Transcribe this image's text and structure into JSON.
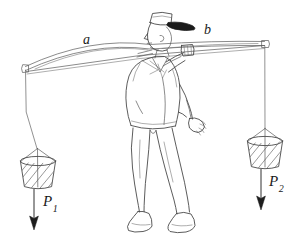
{
  "figure": {
    "kind": "physics-line-drawing",
    "background_color": "#ffffff",
    "ink_color": "#4a4a4a",
    "label_color": "#1a1a1a",
    "width": 298,
    "height": 249
  },
  "labels": {
    "segment_a": "a",
    "segment_b": "b",
    "force_left": "P",
    "force_left_sub": "1",
    "force_right": "P",
    "force_right_sub": "2"
  },
  "scene": {
    "pole": {
      "name": "carrying-pole",
      "left_end": [
        25,
        68
      ],
      "right_end": [
        265,
        43
      ],
      "shoulder_contact": [
        140,
        55
      ],
      "hand_grip": [
        185,
        52
      ],
      "bows_upward": true
    },
    "figure_person": {
      "name": "man",
      "facing": "right",
      "pose": "walking",
      "hat": "flat-cap-with-dark-brim",
      "head_center": [
        158,
        32
      ],
      "torso_center": [
        150,
        90
      ],
      "free_hand": [
        196,
        123
      ]
    },
    "load_left": {
      "name": "left-bucket",
      "center": [
        38,
        170
      ],
      "rim_y": 160,
      "hatched": true,
      "rope_top": [
        25,
        68
      ]
    },
    "load_right": {
      "name": "right-bucket",
      "center": [
        265,
        150
      ],
      "rim_y": 140,
      "hatched": true,
      "rope_top": [
        265,
        43
      ]
    },
    "arrow_left": {
      "name": "force-arrow-left",
      "from": [
        34,
        188
      ],
      "to": [
        34,
        228
      ],
      "direction": "down"
    },
    "arrow_right": {
      "name": "force-arrow-right",
      "from": [
        261,
        168
      ],
      "to": [
        261,
        208
      ],
      "direction": "down"
    }
  }
}
